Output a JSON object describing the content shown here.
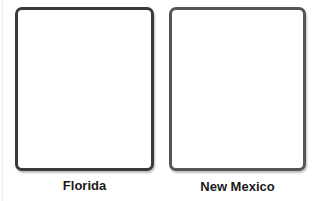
{
  "panels": [
    {
      "label": "Florida",
      "content": ""
    },
    {
      "label": "New Mexico",
      "content": ""
    }
  ],
  "colors": {
    "left_border": "#3a3a3a",
    "right_border": "#555555",
    "background": "#ffffff"
  }
}
